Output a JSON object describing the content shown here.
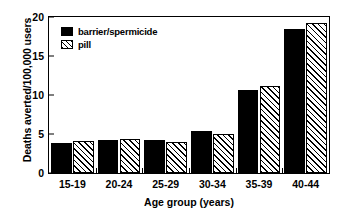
{
  "chart_data": {
    "type": "bar",
    "title": "",
    "xlabel": "Age group (years)",
    "ylabel": "Deaths averted/100,000 users",
    "categories": [
      "15-19",
      "20-24",
      "25-29",
      "30-34",
      "35-39",
      "40-44"
    ],
    "series": [
      {
        "name": "barrier/spermicide",
        "style": "solid-black",
        "color": "#000000",
        "values": [
          3.9,
          4.2,
          4.2,
          5.4,
          10.6,
          18.4
        ]
      },
      {
        "name": "pill",
        "style": "hatched",
        "color": "#000000",
        "values": [
          4.1,
          4.3,
          4.0,
          5.0,
          11.2,
          19.2
        ]
      }
    ],
    "ylim": [
      0,
      20
    ],
    "yticks": [
      0,
      5,
      10,
      15,
      20
    ],
    "ytick_labels": [
      "0",
      "5",
      "10",
      "15",
      "20"
    ],
    "grid": false,
    "legend_position": "top-left",
    "frame": true
  },
  "legend": {
    "items": [
      {
        "label": "barrier/spermicide"
      },
      {
        "label": "pill"
      }
    ]
  },
  "axes": {
    "y_title": "Deaths averted/100,000 users",
    "x_title": "Age group (years)"
  }
}
